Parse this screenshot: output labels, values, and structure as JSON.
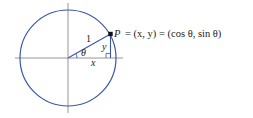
{
  "diagram": {
    "colors": {
      "circle": "#3a56a8",
      "axes": "#8a8a8a",
      "point": "#111111",
      "text": "#222222"
    },
    "labels": {
      "radius": "1",
      "angle": "θ",
      "x_leg": "x",
      "y_leg": "y",
      "point_P": "P",
      "point_equation": "= (x, y) = (cos θ, sin θ)"
    },
    "geometry": {
      "center": [
        68,
        58
      ],
      "radius": 48,
      "point": [
        110.5,
        34
      ]
    }
  }
}
